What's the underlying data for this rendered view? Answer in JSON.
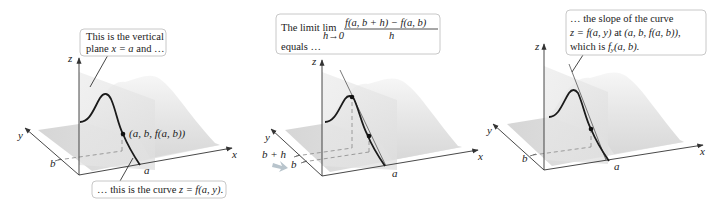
{
  "figure": {
    "panels": [
      {
        "id": "panel-1",
        "callout_top": {
          "line1": "This is the vertical",
          "line2_prefix": "plane ",
          "line2_math": "x = a",
          "line2_suffix": " and …"
        },
        "callout_bottom": {
          "prefix": "… this is the curve ",
          "math": "z = f(a, y)",
          "suffix": "."
        },
        "point_label": "(a, b, f(a, b))",
        "axis_labels": {
          "x": "x",
          "y": "y",
          "z": "z"
        },
        "tick_labels": {
          "a": "a",
          "b": "b"
        }
      },
      {
        "id": "panel-2",
        "callout_top": {
          "prefix": "The limit ",
          "lim": "lim",
          "lim_sub": "h→0",
          "numerator": "f(a, b + h) − f(a, b)",
          "denominator": "h",
          "line2": "equals …"
        },
        "axis_labels": {
          "x": "x",
          "y": "y",
          "z": "z"
        },
        "tick_labels": {
          "a": "a",
          "b": "b",
          "b_plus_h": "b + h"
        }
      },
      {
        "id": "panel-3",
        "callout_top": {
          "line1": "… the slope of the curve",
          "line2_math": "z = f(a, y)",
          "line2_mid": " at ",
          "line2_point": "(a, b, f(a, b)),",
          "line3_prefix": "which is ",
          "line3_math": "f",
          "line3_sub": "y",
          "line3_args": "(a, b)."
        },
        "axis_labels": {
          "x": "x",
          "y": "y",
          "z": "z"
        },
        "tick_labels": {
          "a": "a",
          "b": "b"
        }
      }
    ],
    "colors": {
      "surface_light": "#f0f0f0",
      "surface_mid": "#dcdcdc",
      "plane": "#e4e4e4",
      "curve": "#1a1a1a",
      "callout_border": "#c8c8c8",
      "arrow_hint": "#b8c4cc"
    }
  }
}
